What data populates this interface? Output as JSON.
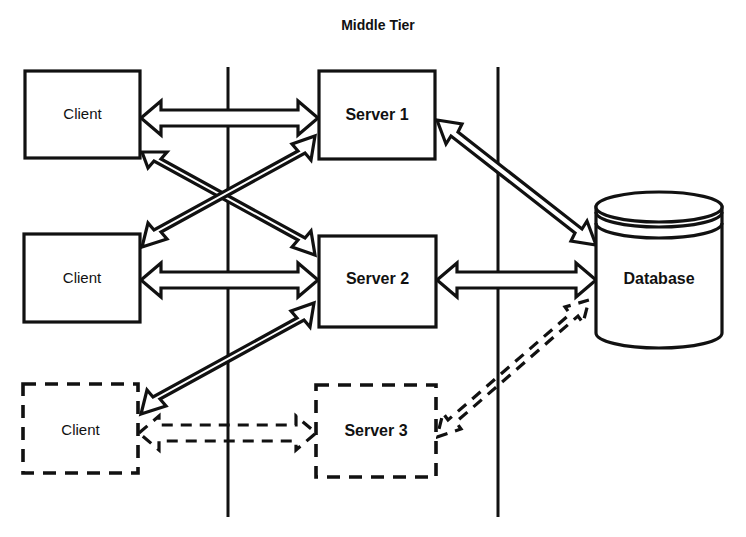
{
  "diagram": {
    "title": "Middle Tier",
    "tiers": [
      {
        "name": "client-tier",
        "divider_x": 228
      },
      {
        "name": "middle-tier",
        "divider_x": 498
      }
    ],
    "nodes": [
      {
        "id": "client1",
        "label": "Client",
        "style": "solid",
        "shape": "rect",
        "x": 25,
        "y": 71,
        "w": 115,
        "h": 87
      },
      {
        "id": "client2",
        "label": "Client",
        "style": "solid",
        "shape": "rect",
        "x": 24,
        "y": 234,
        "w": 116,
        "h": 88
      },
      {
        "id": "client3",
        "label": "Client",
        "style": "dashed",
        "shape": "rect",
        "x": 23,
        "y": 384,
        "w": 115,
        "h": 89
      },
      {
        "id": "server1",
        "label": "Server 1",
        "style": "solid",
        "shape": "rect",
        "x": 319,
        "y": 71,
        "w": 116,
        "h": 88
      },
      {
        "id": "server2",
        "label": "Server 2",
        "style": "solid",
        "shape": "rect",
        "x": 319,
        "y": 236,
        "w": 117,
        "h": 91
      },
      {
        "id": "server3",
        "label": "Server 3",
        "style": "dashed",
        "shape": "rect",
        "x": 316,
        "y": 385,
        "w": 120,
        "h": 92
      },
      {
        "id": "database",
        "label": "Database",
        "style": "solid",
        "shape": "cylinder",
        "x": 596,
        "y": 193,
        "w": 126,
        "h": 155
      }
    ],
    "connections": [
      {
        "from": "client1",
        "to": "server1",
        "style": "solid",
        "arrow": "double",
        "kind": "horizontal"
      },
      {
        "from": "client1",
        "to": "server2",
        "style": "solid",
        "arrow": "double",
        "kind": "diagonal"
      },
      {
        "from": "client2",
        "to": "server1",
        "style": "solid",
        "arrow": "double",
        "kind": "diagonal"
      },
      {
        "from": "client2",
        "to": "server2",
        "style": "solid",
        "arrow": "double",
        "kind": "horizontal"
      },
      {
        "from": "client3",
        "to": "server2",
        "style": "solid",
        "arrow": "double",
        "kind": "diagonal"
      },
      {
        "from": "client3",
        "to": "server3",
        "style": "dashed",
        "arrow": "double",
        "kind": "horizontal"
      },
      {
        "from": "server1",
        "to": "database",
        "style": "solid",
        "arrow": "double",
        "kind": "diagonal"
      },
      {
        "from": "server2",
        "to": "database",
        "style": "solid",
        "arrow": "double",
        "kind": "horizontal"
      },
      {
        "from": "server3",
        "to": "database",
        "style": "dashed",
        "arrow": "double",
        "kind": "diagonal"
      }
    ],
    "colors": {
      "stroke": "#111111",
      "fill": "#ffffff",
      "background": "#ffffff"
    }
  }
}
